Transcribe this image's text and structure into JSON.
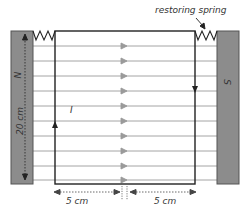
{
  "labels": {
    "restoring_spring": "restoring spring",
    "north_pole": "N",
    "south_pole": "S",
    "height": "20 cm",
    "current": "I",
    "left_width": "5 cm",
    "right_width": "5 cm"
  },
  "colors": {
    "magnet_fill": "#8c8c8c",
    "magnet_stroke": "#555555",
    "loop_stroke": "#222222",
    "field_line": "#9a9a9a",
    "field_arrow": "#9a9a9a",
    "dim_line": "#444444"
  },
  "field_lines": {
    "count": 10
  }
}
